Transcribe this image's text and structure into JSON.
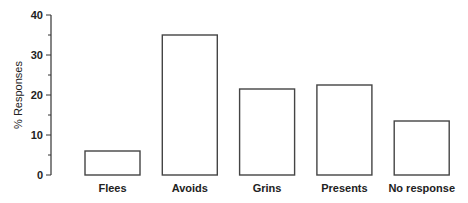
{
  "chart_data": {
    "type": "bar",
    "title": "",
    "xlabel": "",
    "ylabel": "% Responses",
    "categories": [
      "Flees",
      "Avoids",
      "Grins",
      "Presents",
      "No response"
    ],
    "values": [
      6,
      35,
      21.5,
      22.5,
      13.5
    ],
    "ylim": [
      0,
      40
    ],
    "yticks": [
      0,
      10,
      20,
      30,
      40
    ],
    "yticks_minor": [
      5,
      15,
      25,
      35
    ],
    "grid": false,
    "legend": "none",
    "bar_fill": "#ffffff",
    "bar_stroke": "#444444"
  }
}
